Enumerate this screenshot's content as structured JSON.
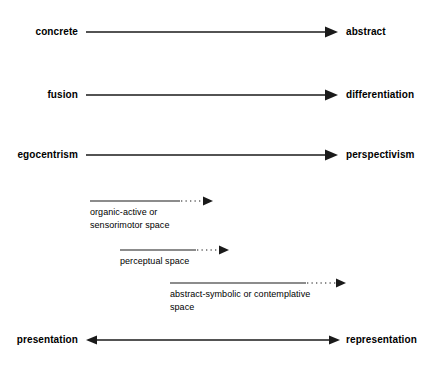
{
  "diagram": {
    "type": "developmental-polarity-diagram",
    "background_color": "#ffffff",
    "line_color": "#1a1a1a",
    "axes": [
      {
        "id": "concrete-abstract",
        "left_label": "concrete",
        "right_label": "abstract",
        "arrow": "single-right",
        "y": 32,
        "line_start_x": 86,
        "line_end_x": 338
      },
      {
        "id": "fusion-differentiation",
        "left_label": "fusion",
        "right_label": "differentiation",
        "arrow": "single-right",
        "y": 95,
        "line_start_x": 86,
        "line_end_x": 338
      },
      {
        "id": "egocentrism-perspectivism",
        "left_label": "egocentrism",
        "right_label": "perspectivism",
        "arrow": "single-right",
        "y": 155,
        "line_start_x": 86,
        "line_end_x": 338
      },
      {
        "id": "presentation-representation",
        "left_label": "presentation",
        "right_label": "representation",
        "arrow": "double",
        "y": 340,
        "line_start_x": 86,
        "line_end_x": 340
      }
    ],
    "spaces": [
      {
        "id": "organic-active-sensorimotor-space",
        "caption": "organic-active or\nsensorimotor space",
        "y": 201,
        "solid_start_x": 90,
        "solid_end_x": 180,
        "dotted_end_x": 213,
        "caption_x": 90,
        "caption_y": 206
      },
      {
        "id": "perceptual-space",
        "caption": "perceptual space",
        "y": 250,
        "solid_start_x": 120,
        "solid_end_x": 196,
        "dotted_end_x": 229,
        "caption_x": 120,
        "caption_y": 255
      },
      {
        "id": "abstract-symbolic-contemplative-space",
        "caption": "abstract-symbolic or contemplative\nspace",
        "y": 283,
        "solid_start_x": 170,
        "solid_end_x": 306,
        "dotted_end_x": 346,
        "caption_x": 170,
        "caption_y": 288
      }
    ]
  }
}
